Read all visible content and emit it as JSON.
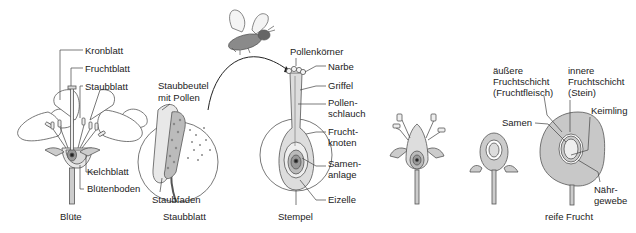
{
  "panels": {
    "bluete": {
      "caption": "Blüte",
      "labels": [
        "Kronblatt",
        "Fruchtblatt",
        "Staubblatt",
        "Kelchblatt",
        "Blütenboden"
      ]
    },
    "staubblatt": {
      "caption": "Staubblatt",
      "labels": [
        "Staubbeutel",
        "mit Pollen",
        "Staubfaden"
      ]
    },
    "stempel": {
      "caption": "Stempel",
      "labels": [
        "Pollenkörner",
        "Narbe",
        "Griffel",
        "Pollen-",
        "schlauch",
        "Frucht-",
        "knoten",
        "Samen-",
        "anlage",
        "Eizelle"
      ]
    },
    "frucht": {
      "caption": "reife Frucht",
      "labels": [
        "äußere",
        "Fruchtschicht",
        "(Fruchtfleisch)",
        "innere",
        "Fruchtschicht",
        "(Stein)",
        "Samen",
        "Keimling",
        "Nähr-",
        "gewebe"
      ]
    }
  },
  "colors": {
    "line": "#444444",
    "fill_light": "#f2f2f2",
    "fill_mid": "#cfcfcf",
    "fill_dark": "#999999",
    "fruit": "#c8c8c8"
  }
}
